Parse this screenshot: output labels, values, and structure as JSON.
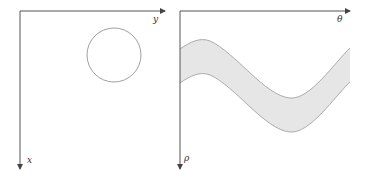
{
  "panels": [
    {
      "name": "image-space",
      "horizontal_axis_label": "y",
      "vertical_axis_label": "x",
      "shape": "circle"
    },
    {
      "name": "hough-space",
      "horizontal_axis_label": "θ",
      "vertical_axis_label": "ρ",
      "shape": "sinusoidal band"
    }
  ],
  "colors": {
    "axis": "#555555",
    "circle_stroke": "#888888",
    "band_fill": "#e6e6e6",
    "band_stroke": "#999999"
  }
}
